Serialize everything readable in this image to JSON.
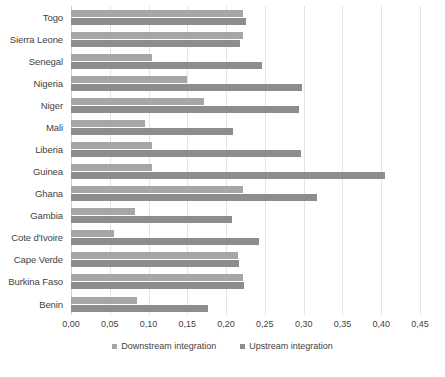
{
  "chart_data": {
    "type": "bar",
    "orientation": "horizontal",
    "title": "",
    "xlabel": "",
    "ylabel": "",
    "xlim": [
      0,
      0.45
    ],
    "grid": true,
    "legend_position": "bottom",
    "decimal_separator": ",",
    "categories": [
      "Togo",
      "Sierra Leone",
      "Senegal",
      "Nigeria",
      "Niger",
      "Mali",
      "Liberia",
      "Guinea",
      "Ghana",
      "Gambia",
      "Cote d'Ivoire",
      "Cape Verde",
      "Burkina Faso",
      "Benin"
    ],
    "tick_labels": [
      "0,00",
      "0,05",
      "0,10",
      "0,15",
      "0,20",
      "0,25",
      "0,30",
      "0,35",
      "0,40",
      "0,45"
    ],
    "tick_values": [
      0.0,
      0.05,
      0.1,
      0.15,
      0.2,
      0.25,
      0.3,
      0.35,
      0.4,
      0.45
    ],
    "series": [
      {
        "name": "Downstream integration",
        "color": "#a6a6a6",
        "values": [
          0.222,
          0.222,
          0.104,
          0.15,
          0.172,
          0.096,
          0.104,
          0.105,
          0.222,
          0.083,
          0.056,
          0.215,
          0.222,
          0.085
        ]
      },
      {
        "name": "Upstream integration",
        "color": "#8d8d8d",
        "values": [
          0.226,
          0.218,
          0.246,
          0.298,
          0.294,
          0.209,
          0.296,
          0.405,
          0.317,
          0.207,
          0.243,
          0.216,
          0.223,
          0.177
        ]
      }
    ]
  }
}
